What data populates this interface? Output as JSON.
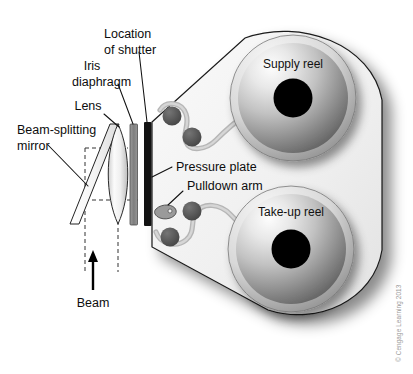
{
  "diagram": {
    "credit": "© Cengage Learning 2013",
    "colors": {
      "body_light": "#f2f2f2",
      "body_edge": "#1a1a1a",
      "film_path": "#b5b5b5",
      "roller": "#555555",
      "hub": "#000000",
      "shutter": "#111111",
      "iris": "#8a8a8a",
      "label_text": "#0d0d0d",
      "credit_text": "#9a9a9a"
    },
    "labels": {
      "location_of_shutter_line1": "Location",
      "location_of_shutter_line2": "of shutter",
      "iris_line1": "Iris",
      "iris_line2": "diaphragm",
      "lens": "Lens",
      "beam_splitting_line1": "Beam-splitting",
      "beam_splitting_line2": "mirror",
      "beam": "Beam",
      "pressure_plate": "Pressure plate",
      "pulldown_arm": "Pulldown arm",
      "supply_reel": "Supply reel",
      "take_up_reel": "Take-up reel"
    },
    "components": [
      {
        "name": "beam-splitting-mirror",
        "type": "tilted-plate"
      },
      {
        "name": "lens",
        "type": "biconvex"
      },
      {
        "name": "iris-diaphragm",
        "type": "vertical-bar"
      },
      {
        "name": "shutter",
        "type": "vertical-bar"
      },
      {
        "name": "pressure-plate",
        "type": "vertical-bar"
      },
      {
        "name": "pulldown-arm",
        "type": "teardrop"
      },
      {
        "name": "supply-reel",
        "type": "reel"
      },
      {
        "name": "take-up-reel",
        "type": "reel"
      },
      {
        "name": "film-path",
        "type": "band"
      },
      {
        "name": "beam",
        "type": "arrow"
      }
    ]
  }
}
